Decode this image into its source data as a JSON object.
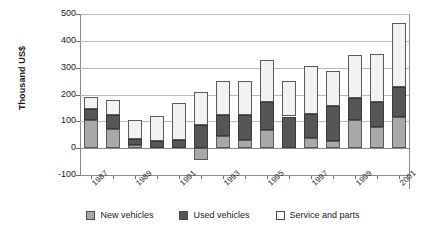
{
  "chart_data": {
    "type": "bar",
    "stacked": true,
    "title": "",
    "xlabel": "",
    "ylabel": "Thousand US$",
    "ylim": [
      -100,
      500
    ],
    "yticks": [
      -100,
      0,
      100,
      200,
      300,
      400,
      500
    ],
    "grid": true,
    "legend_position": "bottom",
    "categories": [
      "1987",
      "1988",
      "1989",
      "1990",
      "1991",
      "1992",
      "1993",
      "1994",
      "1995",
      "1996",
      "1997",
      "1998",
      "1999",
      "2000",
      "2001"
    ],
    "tick_labels": [
      "1987",
      "1989",
      "1991",
      "1993",
      "1995",
      "1997",
      "1999",
      "2001"
    ],
    "series": [
      {
        "name": "New vehicles",
        "color": "#a8a8a8",
        "values": [
          105,
          72,
          12,
          0,
          0,
          -45,
          45,
          30,
          68,
          0,
          38,
          28,
          105,
          80,
          118
        ]
      },
      {
        "name": "Used vehicles",
        "color": "#565656",
        "values": [
          42,
          50,
          22,
          28,
          32,
          85,
          78,
          92,
          105,
          118,
          88,
          130,
          82,
          92,
          110
        ]
      },
      {
        "name": "Service and parts",
        "color": "#f2f2f2",
        "values": [
          43,
          57,
          70,
          93,
          135,
          125,
          128,
          130,
          155,
          132,
          180,
          130,
          160,
          178,
          240
        ]
      }
    ],
    "totals": [
      190,
      179,
      104,
      121,
      167,
      165,
      251,
      252,
      328,
      250,
      306,
      258,
      347,
      350,
      468
    ]
  },
  "legend": {
    "items": [
      {
        "label": "New vehicles",
        "swatch": "swatch-new-vehicles"
      },
      {
        "label": "Used vehicles",
        "swatch": "swatch-used-vehicles"
      },
      {
        "label": "Service and parts",
        "swatch": "swatch-service-and-parts"
      }
    ]
  }
}
